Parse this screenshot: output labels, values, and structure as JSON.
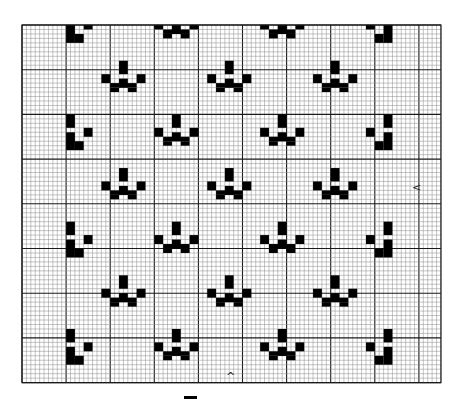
{
  "chart": {
    "origin": [
      22,
      25
    ],
    "cell_w": 4.41,
    "cell_h": 4.47,
    "cols": 95,
    "rows": 80,
    "major_every": 10,
    "colors": {
      "fill": "#000000",
      "minor_line": "#8a8a8a",
      "major_line": "#1a1a1a",
      "background": "#ffffff"
    }
  },
  "motif_templates": {
    "paw": [
      [
        4,
        0,
        2,
        3
      ],
      [
        0,
        3,
        2,
        2
      ],
      [
        8,
        3,
        2,
        2
      ],
      [
        4,
        4,
        2,
        2
      ],
      [
        2,
        5,
        6,
        1
      ],
      [
        2,
        6,
        2,
        1
      ],
      [
        6,
        6,
        2,
        1
      ]
    ],
    "edge_left": [
      [
        0,
        0,
        2,
        3
      ],
      [
        0,
        4,
        2,
        4
      ],
      [
        2,
        6,
        2,
        2
      ],
      [
        4,
        3,
        2,
        2
      ]
    ],
    "edge_right": [
      [
        4,
        0,
        2,
        3
      ],
      [
        4,
        4,
        2,
        4
      ],
      [
        2,
        6,
        2,
        2
      ],
      [
        0,
        3,
        2,
        2
      ]
    ]
  },
  "motifs": [
    {
      "template": "paw",
      "col": 30,
      "row": -4
    },
    {
      "template": "paw",
      "col": 54,
      "row": -4
    },
    {
      "template": "edge_left",
      "col": 10,
      "row": -4
    },
    {
      "template": "edge_right",
      "col": 78,
      "row": -4
    },
    {
      "template": "paw",
      "col": 18,
      "row": 8
    },
    {
      "template": "paw",
      "col": 42,
      "row": 8
    },
    {
      "template": "paw",
      "col": 66,
      "row": 8
    },
    {
      "template": "edge_left",
      "col": 10,
      "row": 20
    },
    {
      "template": "paw",
      "col": 30,
      "row": 20
    },
    {
      "template": "paw",
      "col": 54,
      "row": 20
    },
    {
      "template": "edge_right",
      "col": 78,
      "row": 20
    },
    {
      "template": "paw",
      "col": 18,
      "row": 32
    },
    {
      "template": "paw",
      "col": 42,
      "row": 32
    },
    {
      "template": "paw",
      "col": 66,
      "row": 32
    },
    {
      "template": "edge_left",
      "col": 10,
      "row": 44
    },
    {
      "template": "paw",
      "col": 30,
      "row": 44
    },
    {
      "template": "paw",
      "col": 54,
      "row": 44
    },
    {
      "template": "edge_right",
      "col": 78,
      "row": 44
    },
    {
      "template": "paw",
      "col": 18,
      "row": 56
    },
    {
      "template": "paw",
      "col": 42,
      "row": 56
    },
    {
      "template": "paw",
      "col": 66,
      "row": 56
    },
    {
      "template": "edge_left",
      "col": 10,
      "row": 68
    },
    {
      "template": "paw",
      "col": 30,
      "row": 68
    },
    {
      "template": "paw",
      "col": 54,
      "row": 68
    },
    {
      "template": "edge_right",
      "col": 78,
      "row": 68
    }
  ],
  "markers": {
    "side_arrow": {
      "glyph": "<",
      "x": 412,
      "y": 182
    },
    "bottom_arrow": {
      "glyph": "^",
      "x": 226,
      "y": 371
    },
    "bottom_bar": {
      "x": 184,
      "y": 396,
      "w": 13,
      "h": 3
    }
  }
}
